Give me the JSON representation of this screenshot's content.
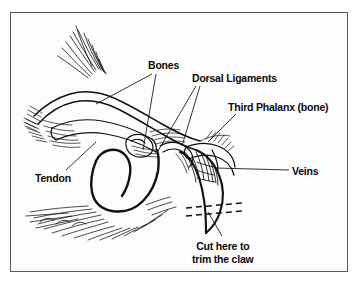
{
  "figure": {
    "kind": "anatomical-line-drawing",
    "frame_color": "#555a5e",
    "background_color": "#fdfdfd",
    "ink_color": "#111111",
    "label_color": "#0b0b0b"
  },
  "labels": {
    "bones": "Bones",
    "dorsal_ligaments": "Dorsal Ligaments",
    "third_phalanx": "Third Phalanx (bone)",
    "veins": "Veins",
    "tendon": "Tendon",
    "cut_line_1": "Cut here to",
    "cut_line_2": "trim the claw"
  },
  "annotations": {
    "cut_marker": "two parallel dashed lines across the claw",
    "leader_lines": 7
  }
}
